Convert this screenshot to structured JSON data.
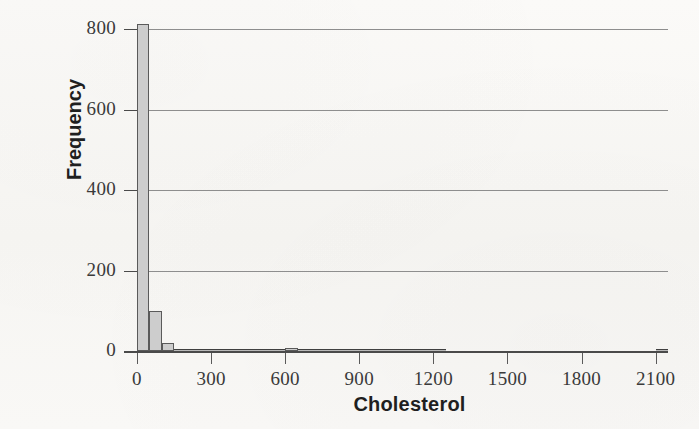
{
  "chart_data": {
    "type": "bar",
    "title": "",
    "subtitle": "",
    "xlabel": "Cholesterol",
    "ylabel": "Frequency",
    "xlim": [
      -60,
      2150
    ],
    "ylim": [
      0,
      800
    ],
    "grid": true,
    "legend": null,
    "bin_width": 50,
    "x_ticks": [
      0,
      300,
      600,
      900,
      1200,
      1500,
      1800,
      2100
    ],
    "x_tick_labels": [
      "0",
      "300",
      "600",
      "900",
      "1200",
      "1500",
      "1800",
      "2100"
    ],
    "y_ticks": [
      0,
      200,
      400,
      600,
      800
    ],
    "y_tick_labels": [
      "0",
      "200",
      "400",
      "600",
      "800"
    ],
    "bin_starts": [
      0,
      50,
      100,
      150,
      200,
      250,
      300,
      350,
      400,
      450,
      500,
      550,
      600,
      650,
      700,
      750,
      800,
      850,
      900,
      950,
      1000,
      1050,
      1100,
      1150,
      1200,
      2100
    ],
    "values": [
      812,
      100,
      20,
      5,
      3,
      2,
      2,
      1,
      1,
      1,
      1,
      2,
      8,
      3,
      1,
      1,
      1,
      1,
      2,
      1,
      1,
      1,
      1,
      2,
      1,
      3
    ],
    "colors": {
      "bar_fill": "#cdcdcd",
      "bar_edge": "#5a5a5a",
      "gridline": "#8e8e8e",
      "axis": "#4a4a4a",
      "background": "#f8f7f4",
      "text": "#1f1f1f"
    }
  },
  "axes": {
    "y": {
      "label": "Frequency",
      "ticks": [
        {
          "value": 800,
          "label": "800"
        },
        {
          "value": 600,
          "label": "600"
        },
        {
          "value": 400,
          "label": "400"
        },
        {
          "value": 200,
          "label": "200"
        },
        {
          "value": 0,
          "label": "0"
        }
      ]
    },
    "x": {
      "label": "Cholesterol",
      "ticks": [
        {
          "value": 0,
          "label": "0"
        },
        {
          "value": 300,
          "label": "300"
        },
        {
          "value": 600,
          "label": "600"
        },
        {
          "value": 900,
          "label": "900"
        },
        {
          "value": 1200,
          "label": "1200"
        },
        {
          "value": 1500,
          "label": "1500"
        },
        {
          "value": 1800,
          "label": "1800"
        },
        {
          "value": 2100,
          "label": "2100"
        }
      ]
    }
  }
}
